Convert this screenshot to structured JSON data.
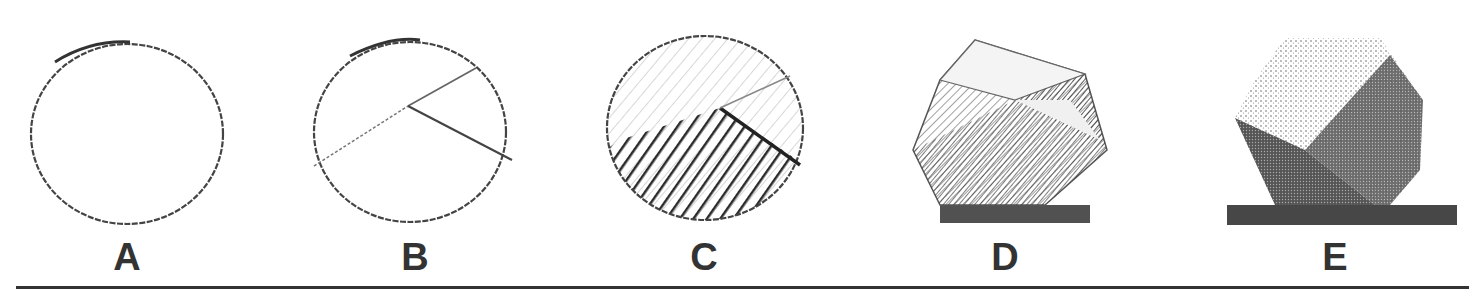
{
  "figure": {
    "panels": [
      {
        "label": "A",
        "description": "plain circle outline"
      },
      {
        "label": "B",
        "description": "circle with two construction lines meeting at a vertex"
      },
      {
        "label": "C",
        "description": "circle with lower half hatched darkly, upper half lightly hatched"
      },
      {
        "label": "D",
        "description": "faceted polyhedron with shaded planes and cast shadow"
      },
      {
        "label": "E",
        "description": "fully shaded faceted polyhedron with cast shadow"
      }
    ],
    "colors": {
      "ink": "#333333",
      "background": "#ffffff"
    }
  }
}
